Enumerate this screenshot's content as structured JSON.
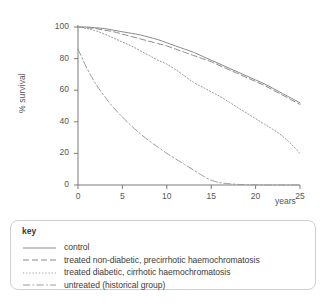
{
  "chart_data": {
    "type": "line",
    "title": "",
    "xlabel": "years",
    "ylabel": "% survival",
    "xlim": [
      0,
      25
    ],
    "ylim": [
      0,
      100
    ],
    "grid": false,
    "legend_position": "below",
    "x_ticks": [
      "0",
      "5",
      "10",
      "15",
      "20",
      "25"
    ],
    "y_ticks": [
      "0",
      "20",
      "40",
      "60",
      "80",
      "100"
    ],
    "x_tick_values": [
      0,
      5,
      10,
      15,
      20,
      25
    ],
    "y_tick_values": [
      0,
      20,
      40,
      60,
      80,
      100
    ],
    "x": [
      0,
      1,
      2,
      3,
      4,
      5,
      6,
      7,
      8,
      9,
      10,
      11,
      12,
      13,
      14,
      15,
      16,
      17,
      18,
      19,
      20,
      21,
      22,
      23,
      24,
      25
    ],
    "series": [
      {
        "name": "control",
        "line_style": "solid",
        "color": "#8a8a8a",
        "values": [
          100,
          100,
          99.5,
          99,
          98,
          97,
          96,
          95,
          93.5,
          92,
          90,
          88,
          86,
          84,
          81.5,
          79,
          76.5,
          74,
          71.5,
          69,
          66.5,
          64,
          61,
          58,
          55,
          52
        ]
      },
      {
        "name": "treated non-diabetic, precirrhotic haemochromatosis",
        "line_style": "dashed",
        "color": "#8a8a8a",
        "values": [
          100,
          99.5,
          99,
          98,
          97,
          95.5,
          94,
          92.5,
          91,
          89.5,
          88,
          86,
          84,
          82,
          80,
          78,
          75.5,
          73,
          70.5,
          68,
          65.5,
          63,
          60,
          57,
          54,
          51
        ]
      },
      {
        "name": "treated diabetic, cirrhotic haemochromatosis",
        "line_style": "dotted",
        "color": "#9a9a9a",
        "values": [
          100,
          99,
          97.5,
          95.5,
          93,
          90.5,
          88,
          85,
          82,
          79,
          76.5,
          73,
          69,
          65,
          62,
          59,
          56,
          52.5,
          49,
          45.5,
          42,
          38.5,
          35,
          31,
          26,
          20
        ]
      },
      {
        "name": "untreated (historical group)",
        "line_style": "dashdot",
        "color": "#9a9a9a",
        "values": [
          86,
          74,
          64,
          56,
          49,
          43,
          37.5,
          32.5,
          28,
          24,
          20,
          16.5,
          13,
          9.5,
          6,
          3,
          1.5,
          0.8,
          0.4,
          0.2,
          0.1,
          0,
          0,
          0,
          0,
          0
        ]
      }
    ]
  },
  "legend": {
    "title": "key",
    "items": [
      {
        "label": "control",
        "style": "solid"
      },
      {
        "label": "treated non-diabetic, precirrhotic haemochromatosis",
        "style": "dashed"
      },
      {
        "label": "treated diabetic, cirrhotic haemochromatosis",
        "style": "dotted"
      },
      {
        "label": "untreated (historical group)",
        "style": "dashdot"
      }
    ]
  },
  "colors": {
    "axis": "#7a7a7a",
    "text": "#4a4a4a",
    "legend_border": "#cfcfcf",
    "background": "#ffffff"
  }
}
